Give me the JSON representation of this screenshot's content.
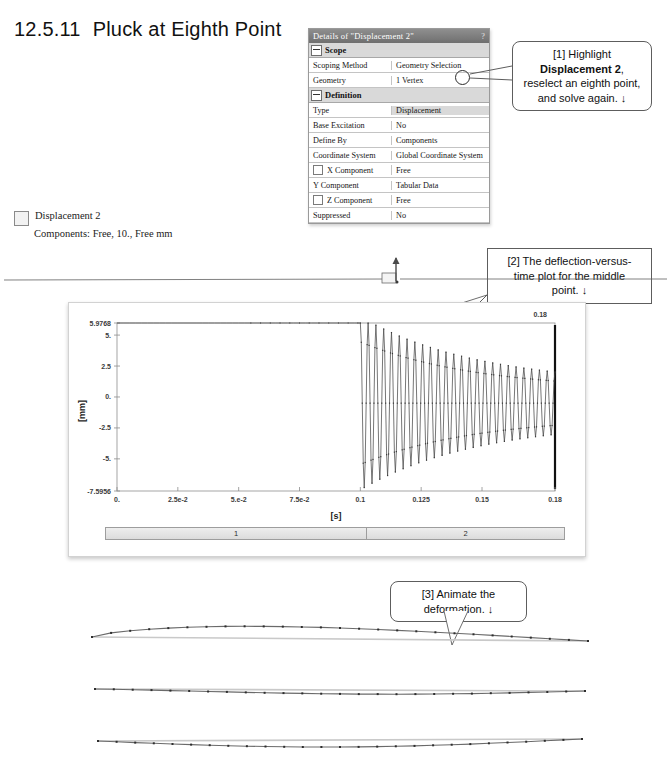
{
  "heading": {
    "number": "12.5.11",
    "title": "Pluck at Eighth Point"
  },
  "legend": {
    "label": "Displacement 2",
    "components": "Components: Free, 10., Free mm",
    "swatch_icon": "empty-square-swatch"
  },
  "details_panel": {
    "title": "Details of \"Displacement 2\"",
    "help_icon": "question-mark-icon",
    "groups": [
      {
        "name": "Scope",
        "expander_icon": "collapse-minus-icon",
        "rows": [
          {
            "key": "Scoping Method",
            "value": "Geometry Selection",
            "checkbox": false,
            "shaded": false
          },
          {
            "key": "Geometry",
            "value": "1 Vertex",
            "checkbox": false,
            "shaded": false
          }
        ]
      },
      {
        "name": "Definition",
        "expander_icon": "collapse-minus-icon",
        "rows": [
          {
            "key": "Type",
            "value": "Displacement",
            "checkbox": false,
            "shaded": true
          },
          {
            "key": "Base Excitation",
            "value": "No",
            "checkbox": false,
            "shaded": false
          },
          {
            "key": "Define By",
            "value": "Components",
            "checkbox": false,
            "shaded": false
          },
          {
            "key": "Coordinate System",
            "value": "Global Coordinate System",
            "checkbox": false,
            "shaded": false
          },
          {
            "key": "X Component",
            "value": "Free",
            "checkbox": true,
            "shaded": false
          },
          {
            "key": "Y Component",
            "value": "Tabular Data",
            "checkbox": false,
            "shaded": false
          },
          {
            "key": "Z Component",
            "value": "Free",
            "checkbox": true,
            "shaded": false
          },
          {
            "key": "Suppressed",
            "value": "No",
            "checkbox": false,
            "shaded": false
          }
        ]
      }
    ]
  },
  "callouts": [
    {
      "id": "callout-1",
      "line1": "[1] Highlight",
      "bold": "Displacement 2",
      "line2_tail": ",",
      "line3": "reselect an eighth point,",
      "line4": "and solve again.  ↓"
    },
    {
      "id": "callout-2",
      "line1": "[2] The deflection-versus-",
      "line2": "time plot for the middle",
      "line3": "point.  ↓"
    },
    {
      "id": "callout-3",
      "line1": "[3] Animate the",
      "line2": "deformation.  ↓"
    }
  ],
  "chart_data": {
    "type": "line",
    "title": "",
    "xlabel": "[s]",
    "ylabel": "[mm]",
    "xlim": [
      0.0,
      0.18
    ],
    "ylim": [
      -7.5956,
      5.9768
    ],
    "grid": false,
    "legend_position": "none",
    "top_right_label": "0.18",
    "ytick_labels": [
      "5.9768",
      "5.",
      "2.5",
      "0.",
      "-2.5",
      "-5.",
      "-7.5956"
    ],
    "ytick_values": [
      5.9768,
      5.0,
      2.5,
      0.0,
      -2.5,
      -5.0,
      -7.5956
    ],
    "xtick_labels": [
      "0.",
      "2.5e-2",
      "5.e-2",
      "7.5e-2",
      "0.1",
      "0.125",
      "0.15",
      "0.18"
    ],
    "xtick_values": [
      0.0,
      0.025,
      0.05,
      0.075,
      0.1,
      0.125,
      0.15,
      0.18
    ],
    "series": [
      {
        "name": "Displacement 2",
        "description": "Constant hold at 5.9768 mm until t = 0.1 s, then exponentially damped free oscillation about ~0 mm decaying to roughly +/-1.5 mm at t = 0.18 s",
        "hold_value": 5.9768,
        "release_time": 0.1,
        "end_time": 0.18,
        "initial_amplitude": 7.0,
        "final_amplitude": 1.5,
        "mean_after_release": -0.5,
        "period": 0.0032,
        "damping": 21.0,
        "marker": "point"
      }
    ],
    "timeline_segments": [
      {
        "label": "1",
        "width_fraction": 0.57
      },
      {
        "label": "2",
        "width_fraction": 0.43
      }
    ]
  },
  "model_strip": {
    "name": "undeformed-beam-with-load-marker",
    "load_marker_icon": "point-load-arrow-icon"
  },
  "deformed_shapes": [
    {
      "name": "deformed-beam-frame-1"
    },
    {
      "name": "deformed-beam-frame-2"
    },
    {
      "name": "deformed-beam-frame-3"
    }
  ],
  "colors": {
    "plot_line": "#4a4a4a",
    "panel_border": "#9a9a9a",
    "title_bar": "#7c7c7c",
    "row_shaded": "#d9d9d9"
  }
}
